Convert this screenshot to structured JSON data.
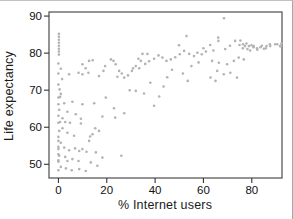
{
  "figure": {
    "kind": "scatter-plot-figure",
    "background": "#ffffff",
    "frame_color": "#4d4d4d",
    "tick_color": "#333333",
    "tick_label_color": "#111111",
    "point_color": "#b3b3b3"
  },
  "chart_data": {
    "type": "scatter",
    "title": "",
    "xlabel": "% Internet users",
    "ylabel": "Life expectancy",
    "x_ticks": [
      0,
      20,
      40,
      60,
      80
    ],
    "y_ticks": [
      50,
      60,
      70,
      80,
      90
    ],
    "xlim": [
      -3.9,
      92.5
    ],
    "ylim": [
      46.3,
      91.1
    ],
    "grid": false,
    "legend": "none",
    "points": [
      [
        0.2,
        85.2
      ],
      [
        0.2,
        84.4
      ],
      [
        0.2,
        83.6
      ],
      [
        0.2,
        82.8
      ],
      [
        0.2,
        82.0
      ],
      [
        0.2,
        81.2
      ],
      [
        0.2,
        80.4
      ],
      [
        0.2,
        79.6
      ],
      [
        0.0,
        77.2
      ],
      [
        1.0,
        75.8
      ],
      [
        0.0,
        74.5
      ],
      [
        1.5,
        73.0
      ],
      [
        0.0,
        71.5
      ],
      [
        0.5,
        70.2
      ],
      [
        1.0,
        69.0
      ],
      [
        0.0,
        68.0
      ],
      [
        0.7,
        68.2
      ],
      [
        0.0,
        66.2
      ],
      [
        2.4,
        66.5
      ],
      [
        0.3,
        64.7
      ],
      [
        0.0,
        63.1
      ],
      [
        1.7,
        62.4
      ],
      [
        0.0,
        61.2
      ],
      [
        0.7,
        61.4
      ],
      [
        1.7,
        59.7
      ],
      [
        0.3,
        59.0
      ],
      [
        0.0,
        57.4
      ],
      [
        0.0,
        56.3
      ],
      [
        1.0,
        55.8
      ],
      [
        0.0,
        54.7
      ],
      [
        0.0,
        54.1
      ],
      [
        2.4,
        54.5
      ],
      [
        0.0,
        52.7
      ],
      [
        0.3,
        52.3
      ],
      [
        2.8,
        52.0
      ],
      [
        0.0,
        51.1
      ],
      [
        0.0,
        50.7
      ],
      [
        1.0,
        49.3
      ],
      [
        0.0,
        48.4
      ],
      [
        2.8,
        61.4
      ],
      [
        4.8,
        61.2
      ],
      [
        9.3,
        61.0
      ],
      [
        3.7,
        58.5
      ],
      [
        6.5,
        57.7
      ],
      [
        3.7,
        64.2
      ],
      [
        5.8,
        66.9
      ],
      [
        9.9,
        66.2
      ],
      [
        7.2,
        63.5
      ],
      [
        9.3,
        62.3
      ],
      [
        4.4,
        53.8
      ],
      [
        6.9,
        54.3
      ],
      [
        8.6,
        53.6
      ],
      [
        9.9,
        54.1
      ],
      [
        11.6,
        53.4
      ],
      [
        3.7,
        50.9
      ],
      [
        5.8,
        51.4
      ],
      [
        8.3,
        50.9
      ],
      [
        3.1,
        48.9
      ],
      [
        5.5,
        48.4
      ],
      [
        8.6,
        48.7
      ],
      [
        11.3,
        48.2
      ],
      [
        4.4,
        74.3
      ],
      [
        8.3,
        74.7
      ],
      [
        9.9,
        77.0
      ],
      [
        11.3,
        75.9
      ],
      [
        9.9,
        74.3
      ],
      [
        12.4,
        74.7
      ],
      [
        12.7,
        77.9
      ],
      [
        14.2,
        78.1
      ],
      [
        14.8,
        66.5
      ],
      [
        14.1,
        58.1
      ],
      [
        16.8,
        59.0
      ],
      [
        12.7,
        56.3
      ],
      [
        15.5,
        53.2
      ],
      [
        18.2,
        51.8
      ],
      [
        13.4,
        50.5
      ],
      [
        16.1,
        49.6
      ],
      [
        15.2,
        59.7
      ],
      [
        13.1,
        57.5
      ],
      [
        16.8,
        73.8
      ],
      [
        18.6,
        75.2
      ],
      [
        19.3,
        76.5
      ],
      [
        19.6,
        68.0
      ],
      [
        18.2,
        62.9
      ],
      [
        21.7,
        78.3
      ],
      [
        22.8,
        77.9
      ],
      [
        23.7,
        77.0
      ],
      [
        25.1,
        75.2
      ],
      [
        26.2,
        74.5
      ],
      [
        24.4,
        73.6
      ],
      [
        27.2,
        73.4
      ],
      [
        28.8,
        74.0
      ],
      [
        23.0,
        65.1
      ],
      [
        23.5,
        62.6
      ],
      [
        26.0,
        52.3
      ],
      [
        27.2,
        63.8
      ],
      [
        29.5,
        70.0
      ],
      [
        30.4,
        75.2
      ],
      [
        30.9,
        75.9
      ],
      [
        32.0,
        76.5
      ],
      [
        33.1,
        78.5
      ],
      [
        33.4,
        75.9
      ],
      [
        34.1,
        77.9
      ],
      [
        34.8,
        79.8
      ],
      [
        36.8,
        79.8
      ],
      [
        35.9,
        77.1
      ],
      [
        37.5,
        77.8
      ],
      [
        39.6,
        78.5
      ],
      [
        32.0,
        69.8
      ],
      [
        35.4,
        69.1
      ],
      [
        39.6,
        65.8
      ],
      [
        38.0,
        72.0
      ],
      [
        41.4,
        79.4
      ],
      [
        43.0,
        78.8
      ],
      [
        44.7,
        77.9
      ],
      [
        46.5,
        78.3
      ],
      [
        48.3,
        78.9
      ],
      [
        41.7,
        68.3
      ],
      [
        43.5,
        71.0
      ],
      [
        45.0,
        73.5
      ],
      [
        47.0,
        75.5
      ],
      [
        49.9,
        82.1
      ],
      [
        50.2,
        79.7
      ],
      [
        52.0,
        80.6
      ],
      [
        53.0,
        84.6
      ],
      [
        54.1,
        79.8
      ],
      [
        56.1,
        79.2
      ],
      [
        57.5,
        80.1
      ],
      [
        59.3,
        79.7
      ],
      [
        61.0,
        80.4
      ],
      [
        60.0,
        81.3
      ],
      [
        55.0,
        76.5
      ],
      [
        58.0,
        77.5
      ],
      [
        51.5,
        74.5
      ],
      [
        53.5,
        72.5
      ],
      [
        62.8,
        82.2
      ],
      [
        64.1,
        80.7
      ],
      [
        66.2,
        83.3
      ],
      [
        66.1,
        84.2
      ],
      [
        69.0,
        81.1
      ],
      [
        71.0,
        82.0
      ],
      [
        73.1,
        83.3
      ],
      [
        74.9,
        82.2
      ],
      [
        63.6,
        77.9
      ],
      [
        66.4,
        77.4
      ],
      [
        69.8,
        77.0
      ],
      [
        72.6,
        77.9
      ],
      [
        74.6,
        78.8
      ],
      [
        65.7,
        75.2
      ],
      [
        68.4,
        74.3
      ],
      [
        71.1,
        74.7
      ],
      [
        73.9,
        73.4
      ],
      [
        62.9,
        73.4
      ],
      [
        65.0,
        72.5
      ],
      [
        68.5,
        89.4
      ],
      [
        75.3,
        83.4
      ],
      [
        76.3,
        81.3
      ],
      [
        77.2,
        81.9
      ],
      [
        78.2,
        81.1
      ],
      [
        79.3,
        80.7
      ],
      [
        80.7,
        81.6
      ],
      [
        82.3,
        80.9
      ],
      [
        84.2,
        82.0
      ],
      [
        85.8,
        81.3
      ],
      [
        87.6,
        81.9
      ],
      [
        89.7,
        82.4
      ],
      [
        91.7,
        81.9
      ],
      [
        92.0,
        82.0
      ],
      [
        76.7,
        78.3
      ],
      [
        76.4,
        82.4
      ],
      [
        77.8,
        82.6
      ],
      [
        78.8,
        81.9
      ],
      [
        79.9,
        82.1
      ],
      [
        80.8,
        81.9
      ],
      [
        82.2,
        81.3
      ],
      [
        83.6,
        81.6
      ],
      [
        85.0,
        81.2
      ],
      [
        86.1,
        81.9
      ],
      [
        87.5,
        82.4
      ],
      [
        90.5,
        82.4
      ],
      [
        91.9,
        81.9
      ],
      [
        92.3,
        82.6
      ]
    ]
  }
}
